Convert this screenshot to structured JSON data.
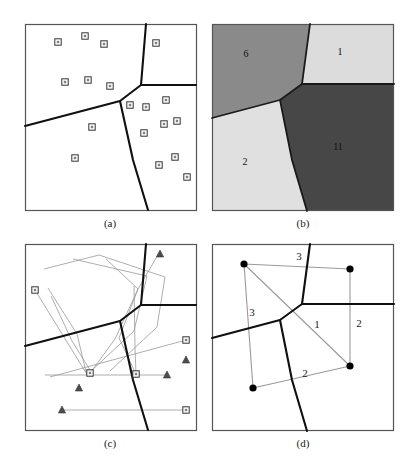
{
  "figure": {
    "title": "",
    "panels": [
      {
        "id": "a",
        "caption": "(a)"
      },
      {
        "id": "b",
        "caption": "(b)"
      },
      {
        "id": "c",
        "caption": "(c)"
      },
      {
        "id": "d",
        "caption": "(d)"
      }
    ]
  },
  "colors": {
    "background": "#ffffff",
    "panel_border": "#555555",
    "partition_line": "#101010",
    "marker_stroke": "#333333",
    "marker_fill": "#808080",
    "trajectory_line": "#999999",
    "dot_fill": "#000000",
    "region_6": "#8a8a8a",
    "region_1": "#dcdcdc",
    "region_2": "#e0e0e0",
    "region_11": "#474747",
    "region_border": "#1a1a1a"
  },
  "chart_data": {
    "type": "diagram",
    "panel_a": {
      "caption": "(a)",
      "description": "Square domain split into three regions by thick polylines; small open square markers scattered inside.",
      "frame": {
        "x": 25,
        "y": 24,
        "w": 171,
        "h": 186
      },
      "partition_vertex": [
        120,
        101
      ],
      "partition_segments": [
        {
          "name": "upper-right-branch",
          "points": [
            [
              146,
              24
            ],
            [
              141,
              85
            ]
          ]
        },
        {
          "name": "horizontal-branch",
          "points": [
            [
              141,
              85
            ],
            [
              196,
              85
            ]
          ]
        },
        {
          "name": "upper-left-branch",
          "points": [
            [
              141,
              85
            ],
            [
              120,
              101
            ],
            [
              25,
              126
            ]
          ]
        },
        {
          "name": "lower-branch",
          "points": [
            [
              120,
              101
            ],
            [
              133,
              160
            ],
            [
              148,
              210
            ]
          ]
        }
      ],
      "markers": {
        "shape": "open-square",
        "count": 18,
        "points": [
          [
            58,
            42
          ],
          [
            85,
            36
          ],
          [
            104,
            44
          ],
          [
            156,
            43
          ],
          [
            65,
            82
          ],
          [
            88,
            80
          ],
          [
            110,
            86
          ],
          [
            130,
            105
          ],
          [
            146,
            107
          ],
          [
            166,
            100
          ],
          [
            92,
            127
          ],
          [
            144,
            133
          ],
          [
            164,
            124
          ],
          [
            177,
            121
          ],
          [
            75,
            158
          ],
          [
            159,
            165
          ],
          [
            175,
            157
          ],
          [
            187,
            177
          ]
        ]
      }
    },
    "panel_b": {
      "caption": "(b)",
      "description": "Same partition filled with four gray levels; each region labeled with the number of points it contains.",
      "frame": {
        "x": 212,
        "y": 24,
        "w": 182,
        "h": 187
      },
      "regions": [
        {
          "label": "6",
          "value": 6,
          "color": "#8a8a8a",
          "label_pos": [
            246,
            57
          ]
        },
        {
          "label": "1",
          "value": 1,
          "color": "#dcdcdc",
          "label_pos": [
            340,
            55
          ]
        },
        {
          "label": "2",
          "value": 2,
          "color": "#e0e0e0",
          "label_pos": [
            245,
            165
          ]
        },
        {
          "label": "11",
          "value": 11,
          "color": "#474747",
          "label_pos": [
            338,
            150
          ]
        }
      ],
      "partition_vertex": [
        307,
        99
      ],
      "partition_segments": [
        {
          "name": "upper-right-branch",
          "points": [
            [
              310,
              24
            ],
            [
              302,
              84
            ]
          ]
        },
        {
          "name": "horizontal-branch",
          "points": [
            [
              302,
              84
            ],
            [
              394,
              84
            ]
          ]
        },
        {
          "name": "upper-left-branch",
          "points": [
            [
              302,
              84
            ],
            [
              280,
              100
            ],
            [
              212,
              118
            ]
          ]
        },
        {
          "name": "lower-branch",
          "points": [
            [
              280,
              100
            ],
            [
              292,
              160
            ],
            [
              307,
              211
            ]
          ]
        }
      ]
    },
    "panel_c": {
      "caption": "(c)",
      "description": "Same partition with thin gray polyline trajectories connecting open-square start markers to filled-triangle end markers.",
      "frame": {
        "x": 25,
        "y": 244,
        "w": 171,
        "h": 186
      },
      "partition_vertex": [
        120,
        321
      ],
      "partition_segments": [
        {
          "name": "upper-right-branch",
          "points": [
            [
              146,
              244
            ],
            [
              141,
              305
            ]
          ]
        },
        {
          "name": "horizontal-branch",
          "points": [
            [
              141,
              305
            ],
            [
              196,
              305
            ]
          ]
        },
        {
          "name": "upper-left-branch",
          "points": [
            [
              141,
              305
            ],
            [
              120,
              321
            ],
            [
              25,
              346
            ]
          ]
        },
        {
          "name": "lower-branch",
          "points": [
            [
              120,
              321
            ],
            [
              133,
              380
            ],
            [
              148,
              430
            ]
          ]
        }
      ],
      "paths": [
        {
          "points": [
            [
              35,
              290
            ],
            [
              88,
              376
            ]
          ]
        },
        {
          "points": [
            [
              44,
              269
            ],
            [
              99,
              255
            ],
            [
              165,
              277
            ],
            [
              157,
              327
            ],
            [
              110,
              371
            ]
          ]
        },
        {
          "points": [
            [
              51,
              296
            ],
            [
              72,
              341
            ],
            [
              90,
              370
            ]
          ]
        },
        {
          "points": [
            [
              48,
              288
            ],
            [
              77,
              334
            ],
            [
              86,
              372
            ]
          ]
        },
        {
          "points": [
            [
              73,
              259
            ],
            [
              147,
              276
            ],
            [
              134,
              331
            ],
            [
              90,
              372
            ]
          ]
        },
        {
          "points": [
            [
              106,
              259
            ],
            [
              138,
              289
            ],
            [
              115,
              339
            ],
            [
              88,
              376
            ]
          ]
        },
        {
          "points": [
            [
              159,
              253
            ],
            [
              138,
              289
            ],
            [
              119,
              338
            ],
            [
              135,
              372
            ]
          ]
        },
        {
          "points": [
            [
              134,
              286
            ],
            [
              135,
              348
            ],
            [
              136,
              374
            ]
          ]
        },
        {
          "points": [
            [
              45,
              375
            ],
            [
              167,
              375
            ]
          ]
        },
        {
          "points": [
            [
              50,
              377
            ],
            [
              186,
              340
            ]
          ]
        },
        {
          "points": [
            [
              62,
              410
            ],
            [
              186,
              410
            ]
          ]
        }
      ],
      "start_markers": {
        "shape": "open-square",
        "points": [
          [
            35,
            290
          ],
          [
            90,
            373
          ],
          [
            136,
            374
          ],
          [
            186,
            340
          ],
          [
            186,
            410
          ]
        ]
      },
      "end_markers": {
        "shape": "filled-triangle",
        "points": [
          [
            160,
            254
          ],
          [
            186,
            360
          ],
          [
            167,
            375
          ],
          [
            79,
            388
          ],
          [
            62,
            410
          ]
        ]
      }
    },
    "panel_d": {
      "caption": "(d)",
      "description": "Same partition with four filled dots joined by light gray edges; each edge annotated with a count.",
      "frame": {
        "x": 212,
        "y": 244,
        "w": 182,
        "h": 187
      },
      "partition_vertex": [
        307,
        319
      ],
      "partition_segments": [
        {
          "name": "upper-right-branch",
          "points": [
            [
              310,
              244
            ],
            [
              302,
              304
            ]
          ]
        },
        {
          "name": "horizontal-branch",
          "points": [
            [
              302,
              304
            ],
            [
              394,
              304
            ]
          ]
        },
        {
          "name": "upper-left-branch",
          "points": [
            [
              302,
              304
            ],
            [
              280,
              320
            ],
            [
              212,
              338
            ]
          ]
        },
        {
          "name": "lower-branch",
          "points": [
            [
              280,
              320
            ],
            [
              292,
              380
            ],
            [
              307,
              431
            ]
          ]
        }
      ],
      "nodes": [
        {
          "id": "n-top-left",
          "pos": [
            244,
            264
          ]
        },
        {
          "id": "n-top-right",
          "pos": [
            350,
            269
          ]
        },
        {
          "id": "n-bottom-right",
          "pos": [
            350,
            366
          ]
        },
        {
          "id": "n-bottom-left",
          "pos": [
            253,
            388
          ]
        }
      ],
      "edges": [
        {
          "from": "n-top-left",
          "to": "n-top-right",
          "label": "3",
          "label_pos": [
            299,
            260
          ]
        },
        {
          "from": "n-top-left",
          "to": "n-bottom-left",
          "label": "3",
          "label_pos": [
            252,
            316
          ]
        },
        {
          "from": "n-top-left",
          "to": "n-bottom-right",
          "label": "1",
          "label_pos": [
            317,
            328
          ]
        },
        {
          "from": "n-top-right",
          "to": "n-bottom-right",
          "label": "2",
          "label_pos": [
            359,
            327
          ]
        },
        {
          "from": "n-bottom-left",
          "to": "n-bottom-right",
          "label": "2",
          "label_pos": [
            305,
            377
          ]
        }
      ]
    }
  }
}
